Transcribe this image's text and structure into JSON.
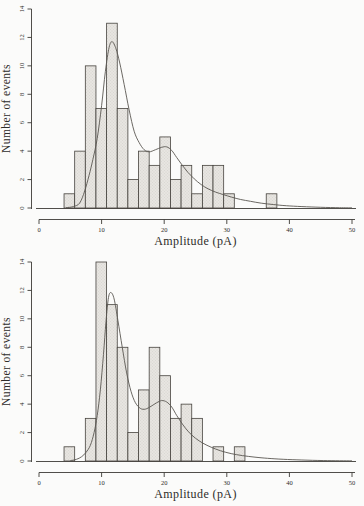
{
  "figure": {
    "background": "#fbfbfa"
  },
  "styles": {
    "bar_fill": "#e7e5e1",
    "bar_dot": "#c2bfb9",
    "bar_stroke": "#46433e",
    "curve_color": "#5a5751",
    "axis_color": "#3c3a36",
    "text_color": "#2e2c29"
  },
  "chart_data": [
    {
      "type": "bar",
      "subtype": "histogram_with_fit_curve",
      "title": "",
      "xlabel": "Amplitude (pA)",
      "ylabel": "Number of events",
      "xlim": [
        0,
        50
      ],
      "ylim": [
        0,
        14
      ],
      "xticks": [
        0,
        10,
        20,
        30,
        40,
        50
      ],
      "yticks": [
        0,
        2,
        4,
        6,
        8,
        10,
        12,
        14
      ],
      "grid": false,
      "legend": "none",
      "bin_start": 4.0,
      "bin_width": 1.7,
      "counts": [
        1,
        4,
        10,
        7,
        13,
        7,
        2,
        4,
        3,
        5,
        2,
        3,
        1,
        3,
        3,
        1,
        0,
        0,
        0,
        1
      ],
      "fit_curve_points": [
        [
          4.3,
          0.02
        ],
        [
          5.5,
          0.1
        ],
        [
          6.5,
          0.35
        ],
        [
          7.3,
          1.2
        ],
        [
          8.0,
          2.3
        ],
        [
          8.6,
          3.4
        ],
        [
          9.3,
          4.9
        ],
        [
          10.0,
          7.2
        ],
        [
          10.6,
          9.6
        ],
        [
          11.2,
          11.3
        ],
        [
          11.7,
          11.7
        ],
        [
          12.3,
          11.2
        ],
        [
          12.9,
          10.2
        ],
        [
          13.6,
          8.7
        ],
        [
          14.4,
          6.9
        ],
        [
          15.2,
          5.4
        ],
        [
          16.0,
          4.6
        ],
        [
          16.8,
          4.1
        ],
        [
          17.6,
          3.95
        ],
        [
          18.6,
          4.1
        ],
        [
          19.6,
          4.27
        ],
        [
          20.4,
          4.3
        ],
        [
          21.2,
          4.05
        ],
        [
          22.0,
          3.55
        ],
        [
          22.9,
          3.0
        ],
        [
          23.8,
          2.5
        ],
        [
          24.8,
          2.05
        ],
        [
          25.9,
          1.65
        ],
        [
          27.0,
          1.35
        ],
        [
          28.2,
          1.12
        ],
        [
          29.4,
          0.95
        ],
        [
          30.8,
          0.76
        ],
        [
          32.2,
          0.6
        ],
        [
          33.8,
          0.47
        ],
        [
          35.5,
          0.34
        ],
        [
          37.5,
          0.24
        ],
        [
          39.5,
          0.16
        ],
        [
          42.0,
          0.1
        ],
        [
          45.0,
          0.05
        ],
        [
          48.0,
          0.02
        ],
        [
          50.0,
          0.01
        ]
      ]
    },
    {
      "type": "bar",
      "subtype": "histogram_with_fit_curve",
      "title": "",
      "xlabel": "Amplitude (pA)",
      "ylabel": "Number of events",
      "xlim": [
        0,
        50
      ],
      "ylim": [
        0,
        14
      ],
      "xticks": [
        0,
        10,
        20,
        30,
        40,
        50
      ],
      "yticks": [
        0,
        2,
        4,
        6,
        8,
        10,
        12,
        14
      ],
      "grid": false,
      "legend": "none",
      "bin_start": 4.0,
      "bin_width": 1.7,
      "counts": [
        1,
        0,
        3,
        14,
        11,
        8,
        2,
        5,
        8,
        6,
        3,
        4,
        3,
        0,
        1,
        0,
        1
      ],
      "fit_curve_points": [
        [
          5.0,
          0.02
        ],
        [
          6.0,
          0.12
        ],
        [
          6.8,
          0.3
        ],
        [
          7.5,
          0.6
        ],
        [
          8.2,
          1.1
        ],
        [
          8.8,
          2.0
        ],
        [
          9.3,
          3.2
        ],
        [
          9.8,
          5.0
        ],
        [
          10.3,
          7.5
        ],
        [
          10.7,
          9.8
        ],
        [
          11.1,
          11.5
        ],
        [
          11.5,
          11.85
        ],
        [
          12.0,
          11.4
        ],
        [
          12.6,
          9.9
        ],
        [
          13.3,
          8.0
        ],
        [
          14.0,
          6.2
        ],
        [
          14.7,
          4.9
        ],
        [
          15.4,
          4.1
        ],
        [
          16.2,
          3.7
        ],
        [
          17.0,
          3.65
        ],
        [
          17.9,
          3.85
        ],
        [
          18.8,
          4.1
        ],
        [
          19.6,
          4.25
        ],
        [
          20.4,
          4.15
        ],
        [
          21.2,
          3.8
        ],
        [
          22.0,
          3.2
        ],
        [
          22.9,
          2.6
        ],
        [
          23.9,
          2.05
        ],
        [
          25.0,
          1.6
        ],
        [
          26.2,
          1.25
        ],
        [
          27.5,
          0.97
        ],
        [
          29.0,
          0.72
        ],
        [
          30.7,
          0.52
        ],
        [
          32.5,
          0.38
        ],
        [
          34.5,
          0.27
        ],
        [
          36.5,
          0.19
        ],
        [
          39.0,
          0.12
        ],
        [
          42.0,
          0.07
        ],
        [
          45.5,
          0.03
        ],
        [
          50.0,
          0.01
        ]
      ]
    }
  ]
}
